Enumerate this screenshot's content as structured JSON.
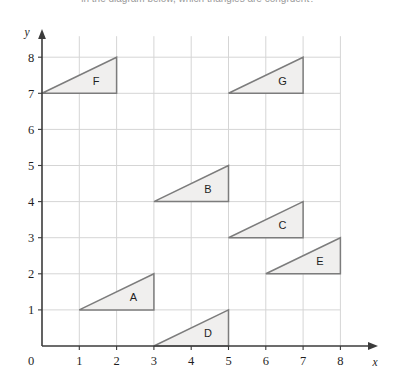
{
  "caption": {
    "text": "in the diagram below, which triangles are congruent?"
  },
  "colors": {
    "grid": "#d5d5d5",
    "axis": "#3b3b3b",
    "shape_fill": "#f0efee",
    "shape_stroke": "#7c7c7c",
    "text": "#1f1f1f"
  },
  "chart_data": {
    "type": "scatter",
    "title": "",
    "xlabel": "x",
    "ylabel": "y",
    "xlim": [
      0,
      8
    ],
    "ylim": [
      0,
      8
    ],
    "xticks": [
      "0",
      "1",
      "2",
      "3",
      "4",
      "5",
      "6",
      "7",
      "8"
    ],
    "yticks": [
      "0",
      "1",
      "2",
      "3",
      "4",
      "5",
      "6",
      "7",
      "8"
    ],
    "grid": true,
    "legend": "none",
    "shapes": [
      {
        "label": "A",
        "kind": "triangle",
        "vertices": [
          [
            1,
            1
          ],
          [
            3,
            2
          ],
          [
            3,
            1
          ]
        ],
        "label_at": [
          2.45,
          1.35
        ],
        "base": 2,
        "height": 1
      },
      {
        "label": "B",
        "kind": "triangle",
        "vertices": [
          [
            3,
            4
          ],
          [
            5,
            5
          ],
          [
            5,
            4
          ]
        ],
        "label_at": [
          4.45,
          4.35
        ],
        "base": 2,
        "height": 1
      },
      {
        "label": "C",
        "kind": "triangle",
        "vertices": [
          [
            5,
            3
          ],
          [
            7,
            4
          ],
          [
            7,
            3
          ]
        ],
        "label_at": [
          6.45,
          3.35
        ],
        "base": 2,
        "height": 1
      },
      {
        "label": "D",
        "kind": "triangle",
        "vertices": [
          [
            3,
            0
          ],
          [
            5,
            1
          ],
          [
            5,
            0
          ]
        ],
        "label_at": [
          4.45,
          0.35
        ],
        "base": 2,
        "height": 1
      },
      {
        "label": "E",
        "kind": "triangle",
        "vertices": [
          [
            6,
            2
          ],
          [
            8,
            3
          ],
          [
            8,
            2
          ]
        ],
        "label_at": [
          7.45,
          2.35
        ],
        "base": 2,
        "height": 1
      },
      {
        "label": "F",
        "kind": "triangle",
        "vertices": [
          [
            0,
            7
          ],
          [
            2,
            8
          ],
          [
            2,
            7
          ]
        ],
        "label_at": [
          1.45,
          7.35
        ],
        "base": 2,
        "height": 1
      },
      {
        "label": "G",
        "kind": "triangle",
        "vertices": [
          [
            5,
            7
          ],
          [
            7,
            8
          ],
          [
            7,
            7
          ]
        ],
        "label_at": [
          6.45,
          7.35
        ],
        "base": 2,
        "height": 1
      }
    ]
  }
}
